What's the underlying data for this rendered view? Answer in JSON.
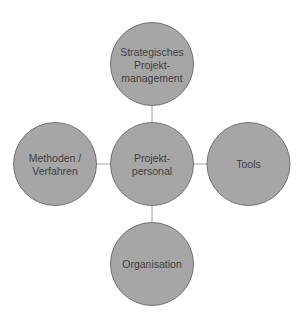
{
  "diagram": {
    "type": "hub-and-spoke",
    "colors": {
      "node_fill": "#a6a6a6",
      "node_stroke": "#5a5a5a",
      "connector": "#a0a0a0",
      "text": "#3f3f3f"
    },
    "center": {
      "id": "center",
      "lines": [
        "Projekt-",
        "personal"
      ]
    },
    "nodes": [
      {
        "id": "top",
        "position": "top",
        "lines": [
          "Strategisches",
          "Projekt-",
          "management"
        ]
      },
      {
        "id": "left",
        "position": "left",
        "lines": [
          "Methoden /",
          "Verfahren"
        ]
      },
      {
        "id": "right",
        "position": "right",
        "lines": [
          "Tools"
        ]
      },
      {
        "id": "bottom",
        "position": "bottom",
        "lines": [
          "Organisation"
        ]
      }
    ]
  }
}
